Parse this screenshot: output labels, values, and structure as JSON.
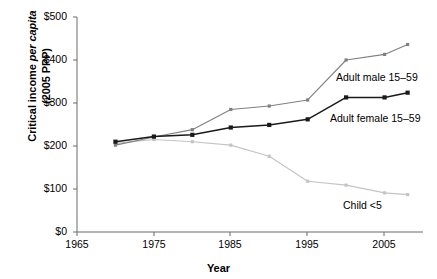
{
  "chart_data": {
    "type": "line",
    "title": "",
    "xlabel": "Year",
    "ylabel": "Critical income per capita (2005 PPP)",
    "ylabel_parts": {
      "pre": "Critical income ",
      "italic": "per capita",
      "post": "(2005 PPP)"
    },
    "xlim": [
      1965,
      2010
    ],
    "ylim": [
      0,
      500
    ],
    "grid": false,
    "legend_position": "inline-annotations",
    "y_tick_labels": [
      "$0",
      "$100",
      "$200",
      "$300",
      "$400",
      "$500"
    ],
    "y_tick_values": [
      0,
      100,
      200,
      300,
      400,
      500
    ],
    "x_tick_labels": [
      "1965",
      "1975",
      "1985",
      "1995",
      "2005"
    ],
    "x_tick_values": [
      1965,
      1975,
      1985,
      1995,
      2005
    ],
    "currency_unit": "2005 PPP US$",
    "series": [
      {
        "name": "Adult male 15–59",
        "label": "Adult male 15–59",
        "color": "#808080",
        "marker": "square",
        "x": [
          1970,
          1975,
          1980,
          1985,
          1990,
          1995,
          2000,
          2005,
          2008
        ],
        "values": [
          202,
          221,
          238,
          285,
          293,
          307,
          400,
          413,
          436
        ]
      },
      {
        "name": "Adult female 15–59",
        "label": "Adult female 15–59",
        "color": "#1a1a1a",
        "marker": "square",
        "x": [
          1970,
          1975,
          1980,
          1985,
          1990,
          1995,
          2000,
          2005,
          2008
        ],
        "values": [
          210,
          222,
          226,
          243,
          249,
          262,
          313,
          313,
          324
        ]
      },
      {
        "name": "Child <5",
        "label": "Child <5",
        "color": "#c4c4c4",
        "marker": "square",
        "x": [
          1970,
          1975,
          1980,
          1985,
          1990,
          1995,
          2000,
          2005,
          2008
        ],
        "values": [
          206,
          215,
          210,
          202,
          176,
          118,
          109,
          91,
          87
        ]
      }
    ],
    "annotations": [
      {
        "name": "adult-male-label",
        "text": "Adult male 15–59",
        "x_px": 336,
        "y_px": 71
      },
      {
        "name": "adult-female-label",
        "text": "Adult female 15–59",
        "x_px": 330,
        "y_px": 112
      },
      {
        "name": "child-label",
        "text": "Child <5",
        "x_px": 343,
        "y_px": 199
      }
    ]
  },
  "axis": {
    "y_ticks": [
      {
        "label": "$500",
        "y_px": 17
      },
      {
        "label": "$400",
        "y_px": 60
      },
      {
        "label": "$300",
        "y_px": 103
      },
      {
        "label": "$200",
        "y_px": 146
      },
      {
        "label": "$100",
        "y_px": 189
      },
      {
        "label": "$0",
        "y_px": 232
      }
    ],
    "x_ticks": [
      {
        "label": "1965",
        "x_px": 77
      },
      {
        "label": "1975",
        "x_px": 154
      },
      {
        "label": "1985",
        "x_px": 230
      },
      {
        "label": "1995",
        "x_px": 307
      },
      {
        "label": "2005",
        "x_px": 384
      }
    ]
  },
  "colors": {
    "axis": "#6b6b6b",
    "adult_male": "#808080",
    "adult_female": "#1a1a1a",
    "child": "#c4c4c4",
    "background": "#ffffff",
    "text": "#000000"
  }
}
